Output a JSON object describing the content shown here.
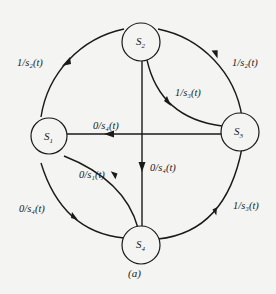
{
  "diagram": {
    "type": "state-transition-diagram",
    "caption": "(a)",
    "nodes": [
      {
        "id": "S1",
        "label": "S",
        "sub": "1"
      },
      {
        "id": "S2",
        "label": "S",
        "sub": "2"
      },
      {
        "id": "S3",
        "label": "S",
        "sub": "3"
      },
      {
        "id": "S4",
        "label": "S",
        "sub": "4"
      }
    ],
    "edges": [
      {
        "from": "S1",
        "to": "S2",
        "label": "1/s₂(t)",
        "route": "outer-arc-upper-left"
      },
      {
        "from": "S2",
        "to": "S3",
        "label": "1/s₂(t)",
        "route": "outer-arc-upper-right"
      },
      {
        "from": "S2",
        "to": "S3",
        "label": "1/s₃(t)",
        "route": "inner-arc"
      },
      {
        "from": "S3",
        "to": "S1",
        "label": "0/s₄(t)",
        "route": "straight-horizontal"
      },
      {
        "from": "S2",
        "to": "S4",
        "label": "0/s₄(t)",
        "route": "straight-vertical"
      },
      {
        "from": "S1",
        "to": "S4",
        "label": "0/s₁(t)",
        "route": "inner-arc"
      },
      {
        "from": "S1",
        "to": "S4",
        "label": "0/s₄(t)",
        "route": "outer-arc-lower-left"
      },
      {
        "from": "S4",
        "to": "S3",
        "label": "1/s₃(t)",
        "route": "outer-arc-lower-right"
      }
    ],
    "labels": {
      "s1_s2": "1/s₂(t)",
      "s2_s3_outer": "1/s₂(t)",
      "s2_s3_inner": "1/s₃(t)",
      "s3_s1": "0/s₄(t)",
      "s2_s4": "0/s₄(t)",
      "s1_s4_inner": "0/s₁(t)",
      "s1_s4_outer": "0/s₄(t)",
      "s4_s3": "1/s₃(t)"
    },
    "colors": {
      "ink": "#1a1a1a",
      "paper": "#f4f4f2"
    }
  }
}
